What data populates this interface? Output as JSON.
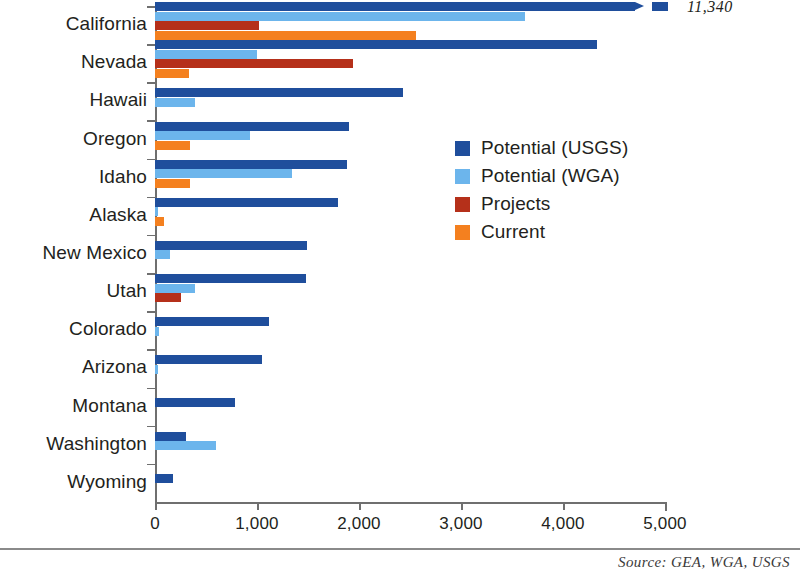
{
  "chart_data": {
    "type": "bar",
    "orientation": "horizontal",
    "title": "",
    "xlabel": "",
    "ylabel": "",
    "xlim": [
      0,
      5000
    ],
    "xticks": [
      "0",
      "1,000",
      "2,000",
      "3,000",
      "4,000",
      "5,000"
    ],
    "xtick_values": [
      0,
      1000,
      2000,
      3000,
      4000,
      5000
    ],
    "grid": false,
    "legend_position": "inside-right",
    "categories": [
      "California",
      "Nevada",
      "Hawaii",
      "Oregon",
      "Idaho",
      "Alaska",
      "New Mexico",
      "Utah",
      "Colorado",
      "Arizona",
      "Montana",
      "Washington",
      "Wyoming"
    ],
    "series": [
      {
        "name": "Potential (USGS)",
        "color": "#1f4e9c",
        "values": [
          11340,
          4330,
          2430,
          1900,
          1880,
          1790,
          1490,
          1480,
          1120,
          1050,
          780,
          300,
          175
        ]
      },
      {
        "name": "Potential (WGA)",
        "color": "#6cb5ec",
        "values": [
          3630,
          1000,
          390,
          930,
          1345,
          30,
          150,
          390,
          35,
          25,
          0,
          600,
          0
        ]
      },
      {
        "name": "Projects",
        "color": "#b5301a",
        "values": [
          1020,
          1940,
          0,
          0,
          0,
          0,
          0,
          250,
          0,
          0,
          0,
          0,
          0
        ]
      },
      {
        "name": "Current",
        "color": "#f4801f",
        "values": [
          2560,
          330,
          0,
          340,
          340,
          90,
          0,
          0,
          0,
          0,
          0,
          0,
          0
        ]
      }
    ],
    "annotations": [
      {
        "text": "11,340",
        "category": "California",
        "series": "Potential (USGS)",
        "note": "broken-axis value label"
      }
    ]
  },
  "footer": {
    "source": "Source: GEA, WGA, USGS"
  }
}
